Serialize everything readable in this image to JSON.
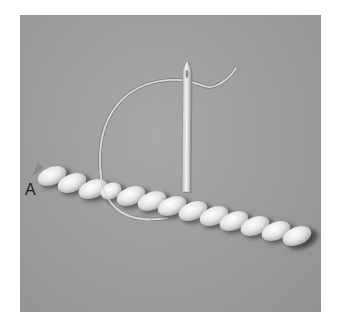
{
  "illustration": {
    "subject": "rope stitch embroidery with needle and thread",
    "label": "A",
    "colors": {
      "background": "#9c9c9c",
      "bead": "#eeeeee",
      "thread": "#d8d8d8",
      "needle": "#e2e2e2"
    }
  }
}
